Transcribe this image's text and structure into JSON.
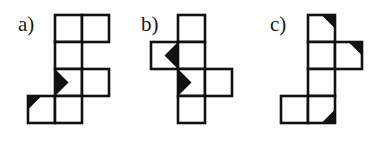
{
  "figure": {
    "kind": "cube-net-diagram",
    "background_color": "#ffffff",
    "ink_color": "#111111",
    "width": 378,
    "height": 152,
    "cell_size": 27,
    "stroke_width": 2.6
  },
  "panels": [
    {
      "id": "a",
      "label": "a)",
      "label_x": 18,
      "label_y": 14,
      "origin_x": 28,
      "origin_y": 15,
      "cells": [
        {
          "col": 1,
          "row": 0
        },
        {
          "col": 2,
          "row": 0
        },
        {
          "col": 1,
          "row": 1
        },
        {
          "col": 1,
          "row": 2
        },
        {
          "col": 2,
          "row": 2
        },
        {
          "col": 0,
          "row": 3
        },
        {
          "col": 1,
          "row": 3
        }
      ],
      "marks": [
        {
          "col": 1,
          "row": 2,
          "shape": "triangle",
          "anchor": "left-edge-point-right",
          "color": "#111111"
        },
        {
          "col": 0,
          "row": 3,
          "shape": "triangle",
          "anchor": "top-left-corner",
          "color": "#111111"
        }
      ]
    },
    {
      "id": "b",
      "label": "b)",
      "label_x": 141,
      "label_y": 14,
      "origin_x": 151,
      "origin_y": 15,
      "cells": [
        {
          "col": 1,
          "row": 0
        },
        {
          "col": 0,
          "row": 1
        },
        {
          "col": 1,
          "row": 1
        },
        {
          "col": 1,
          "row": 2
        },
        {
          "col": 2,
          "row": 2
        },
        {
          "col": 1,
          "row": 3
        }
      ],
      "marks": [
        {
          "col": 0,
          "row": 1,
          "shape": "triangle",
          "anchor": "right-edge-point-left",
          "color": "#111111"
        },
        {
          "col": 1,
          "row": 2,
          "shape": "triangle",
          "anchor": "left-edge-point-right",
          "color": "#111111"
        }
      ]
    },
    {
      "id": "c",
      "label": "c)",
      "label_x": 270,
      "label_y": 14,
      "origin_x": 281,
      "origin_y": 15,
      "cells": [
        {
          "col": 1,
          "row": 0
        },
        {
          "col": 1,
          "row": 1
        },
        {
          "col": 2,
          "row": 1
        },
        {
          "col": 1,
          "row": 2
        },
        {
          "col": 0,
          "row": 3
        },
        {
          "col": 1,
          "row": 3
        }
      ],
      "marks": [
        {
          "col": 1,
          "row": 0,
          "shape": "triangle",
          "anchor": "top-right-corner",
          "color": "#111111"
        },
        {
          "col": 2,
          "row": 1,
          "shape": "triangle",
          "anchor": "top-right-corner",
          "color": "#111111"
        },
        {
          "col": 1,
          "row": 3,
          "shape": "triangle",
          "anchor": "bottom-right-corner",
          "color": "#111111"
        }
      ]
    }
  ]
}
